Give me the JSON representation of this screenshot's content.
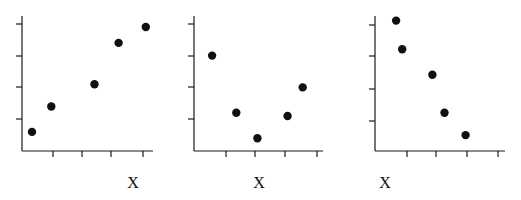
{
  "chart_data": [
    {
      "type": "scatter",
      "title": "",
      "xlabel": "X",
      "ylabel": "",
      "x_ticks": 4,
      "y_ticks": 4,
      "tick_labels": "none",
      "grid": false,
      "legend": "none",
      "xlim": [
        0,
        4.4
      ],
      "ylim": [
        0,
        4.3
      ],
      "x": [
        0.33,
        0.97,
        2.4,
        3.2,
        4.1
      ],
      "y": [
        0.6,
        1.4,
        2.1,
        3.4,
        3.9
      ],
      "trend": "positive"
    },
    {
      "type": "scatter",
      "title": "",
      "xlabel": "X",
      "ylabel": "",
      "x_ticks": 4,
      "y_ticks": 4,
      "tick_labels": "none",
      "grid": false,
      "legend": "none",
      "xlim": [
        0,
        4.3
      ],
      "ylim": [
        0,
        4.3
      ],
      "x": [
        0.6,
        1.4,
        2.1,
        3.1,
        3.6
      ],
      "y": [
        3.0,
        1.2,
        0.4,
        1.1,
        2.0
      ],
      "trend": "u-shaped"
    },
    {
      "type": "scatter",
      "title": "",
      "xlabel": "X",
      "ylabel": "",
      "x_ticks": 4,
      "y_ticks": 4,
      "tick_labels": "none",
      "grid": false,
      "legend": "none",
      "xlim": [
        0,
        4.3
      ],
      "ylim": [
        0,
        4.3
      ],
      "x": [
        0.7,
        0.9,
        1.9,
        2.3,
        3.0
      ],
      "y": [
        4.1,
        3.2,
        2.4,
        1.2,
        0.5
      ],
      "trend": "negative"
    }
  ],
  "panels": [
    {
      "xlabel": "X",
      "layout": {
        "ox": 22,
        "oy": 151,
        "xend": 153,
        "ytop": 16,
        "xstep": 30.2,
        "ystep": 31.8,
        "xticks": [
          53,
          82,
          111,
          143
        ],
        "yticks": [
          24,
          56,
          87,
          119
        ],
        "label_x": 133
      }
    },
    {
      "xlabel": "X",
      "layout": {
        "ox": 194,
        "oy": 151,
        "xend": 323,
        "ytop": 16,
        "xstep": 30.2,
        "ystep": 31.8,
        "xticks": [
          226,
          255,
          285,
          317
        ],
        "yticks": [
          24,
          56,
          87,
          119
        ],
        "label_x": 259
      }
    },
    {
      "xlabel": "X",
      "layout": {
        "ox": 375,
        "oy": 151,
        "xend": 505,
        "ytop": 16,
        "xstep": 30.2,
        "ystep": 31.8,
        "xticks": [
          407,
          436,
          467,
          498
        ],
        "yticks": [
          25,
          56,
          89,
          121
        ],
        "label_x": 385
      }
    }
  ]
}
